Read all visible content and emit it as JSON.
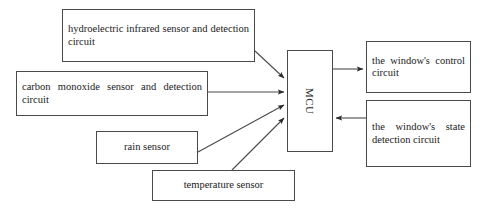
{
  "diagram": {
    "stroke_color": "#4a4a4a",
    "text_color": "#1a1a1a",
    "background_color": "#ffffff",
    "nodes": [
      {
        "id": "hydro",
        "label": "hydroelectric infrared sensor and detection circuit"
      },
      {
        "id": "co",
        "label": "carbon monoxide sensor and detection circuit"
      },
      {
        "id": "rain",
        "label": "rain sensor"
      },
      {
        "id": "temp",
        "label": "temperature sensor"
      },
      {
        "id": "mcu",
        "label": "MCU"
      },
      {
        "id": "control",
        "label": "the window's control circuit"
      },
      {
        "id": "state",
        "label": "the window's state detection circuit"
      }
    ],
    "edges": [
      {
        "from": "hydro",
        "to": "mcu",
        "direction": "to-mcu"
      },
      {
        "from": "co",
        "to": "mcu",
        "direction": "to-mcu"
      },
      {
        "from": "rain",
        "to": "mcu",
        "direction": "to-mcu"
      },
      {
        "from": "temp",
        "to": "mcu",
        "direction": "to-mcu"
      },
      {
        "from": "mcu",
        "to": "control",
        "direction": "from-mcu"
      },
      {
        "from": "state",
        "to": "mcu",
        "direction": "to-mcu"
      }
    ]
  }
}
